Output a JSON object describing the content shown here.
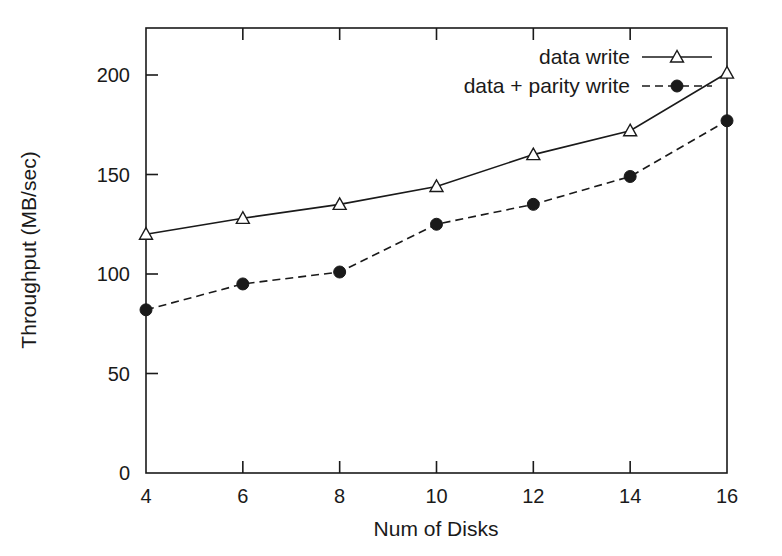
{
  "chart_data": {
    "type": "line",
    "title": "",
    "xlabel": "Num of Disks",
    "ylabel": "Throughput (MB/sec)",
    "x": [
      4,
      6,
      8,
      10,
      12,
      14,
      16
    ],
    "xticklabels": [
      "4",
      "6",
      "8",
      "10",
      "12",
      "14",
      "16"
    ],
    "yticks": [
      0,
      50,
      100,
      150,
      200
    ],
    "yticklabels": [
      "0",
      "50",
      "100",
      "150",
      "200"
    ],
    "xlim": [
      4,
      16
    ],
    "ylim": [
      0,
      220
    ],
    "grid": false,
    "legend_position": "top-right inside",
    "series": [
      {
        "name": "data write",
        "values": [
          120,
          128,
          135,
          144,
          160,
          172,
          201
        ],
        "line_style": "solid",
        "marker": "open-triangle",
        "color": "#1a1a1a"
      },
      {
        "name": "data + parity write",
        "values": [
          82,
          95,
          101,
          125,
          135,
          149,
          177
        ],
        "line_style": "dashed",
        "marker": "filled-circle",
        "color": "#1a1a1a"
      }
    ]
  },
  "legend": {
    "entries": [
      {
        "label": "data write"
      },
      {
        "label": "data + parity write"
      }
    ]
  },
  "axes": {
    "x_title": "Num of Disks",
    "y_title": "Throughput (MB/sec)",
    "x_tick_labels": [
      "4",
      "6",
      "8",
      "10",
      "12",
      "14",
      "16"
    ],
    "y_tick_labels": [
      "0",
      "50",
      "100",
      "150",
      "200"
    ]
  },
  "style": {
    "frame_color": "#1a1a1a",
    "background": "#ffffff"
  }
}
